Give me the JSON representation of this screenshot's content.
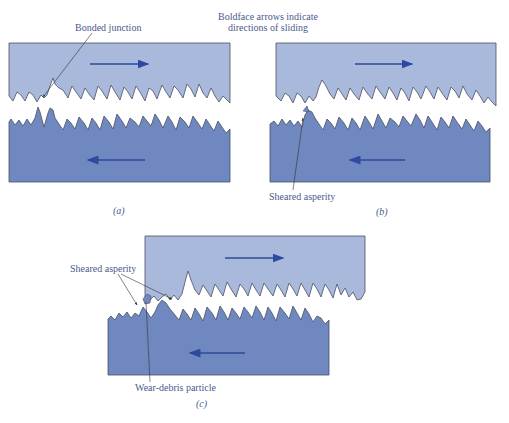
{
  "title_note": {
    "line1": "Boldface arrows indicate",
    "line2": "directions of sliding"
  },
  "panels": [
    {
      "id": "a",
      "caption": "(a)",
      "labels": [
        "Bonded junction"
      ],
      "upper_direction": "right",
      "lower_direction": "left"
    },
    {
      "id": "b",
      "caption": "(b)",
      "labels": [
        "Sheared asperity"
      ],
      "upper_direction": "right",
      "lower_direction": "left"
    },
    {
      "id": "c",
      "caption": "(c)",
      "labels": [
        "Sheared asperity",
        "Wear-debris particle"
      ],
      "upper_direction": "right",
      "lower_direction": "left"
    }
  ],
  "colors": {
    "upper_block": "#a9b9dc",
    "lower_block": "#7088c0",
    "arrow": "#2d4a9e",
    "outline": "#4a4f63",
    "text": "#4a5a8c"
  }
}
